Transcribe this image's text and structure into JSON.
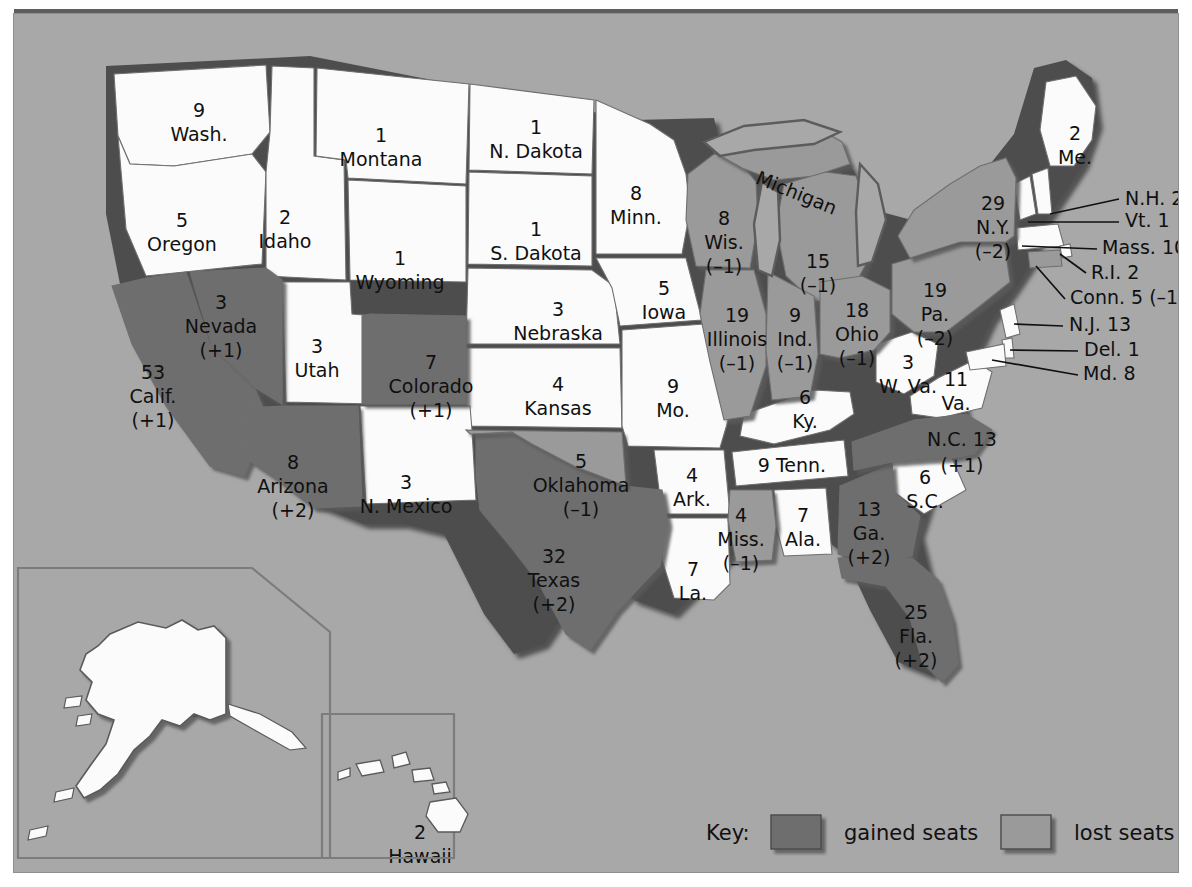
{
  "map": {
    "title": "United States Congressional Apportionment Map",
    "colors": {
      "background": "#a8a8a8",
      "page": "#ffffff",
      "no_change": "#fbfbfb",
      "gained": "#6e6e6e",
      "lost": "#9a9a9a",
      "border": "#3c3c3c",
      "text": "#101010"
    }
  },
  "key": {
    "label": "Key:",
    "items": [
      {
        "swatch": "gained",
        "label": "gained seats",
        "color": "#6e6e6e"
      },
      {
        "swatch": "lost",
        "label": "lost seats",
        "color": "#9a9a9a"
      }
    ]
  },
  "insets": [
    {
      "name": "alaska-inset"
    },
    {
      "name": "hawaii-inset"
    }
  ],
  "states": [
    {
      "id": "wa",
      "name": "Wash.",
      "seats": "9",
      "change": "",
      "status": "no_change",
      "x": 185,
      "y": 103
    },
    {
      "id": "or",
      "name": "Oregon",
      "seats": "5",
      "change": "",
      "status": "no_change",
      "x": 168,
      "y": 213
    },
    {
      "id": "ca",
      "name": "Calif.",
      "seats": "53",
      "change": "(+1)",
      "status": "gained",
      "x": 139,
      "y": 365
    },
    {
      "id": "id",
      "name": "Idaho",
      "seats": "2",
      "change": "",
      "status": "no_change",
      "x": 271,
      "y": 210
    },
    {
      "id": "nv",
      "name": "Nevada",
      "seats": "3",
      "change": "(+1)",
      "status": "gained",
      "x": 207,
      "y": 295
    },
    {
      "id": "ut",
      "name": "Utah",
      "seats": "3",
      "change": "",
      "status": "no_change",
      "x": 303,
      "y": 339
    },
    {
      "id": "az",
      "name": "Arizona",
      "seats": "8",
      "change": "(+2)",
      "status": "gained",
      "x": 279,
      "y": 455
    },
    {
      "id": "mt",
      "name": "Montana",
      "seats": "1",
      "change": "",
      "status": "no_change",
      "x": 367,
      "y": 128
    },
    {
      "id": "wy",
      "name": "Wyoming",
      "seats": "1",
      "change": "",
      "status": "no_change",
      "x": 386,
      "y": 251
    },
    {
      "id": "co",
      "name": "Colorado",
      "seats": "7",
      "change": "(+1)",
      "status": "gained",
      "x": 417,
      "y": 355
    },
    {
      "id": "nm",
      "name": "N. Mexico",
      "seats": "3",
      "change": "",
      "status": "no_change",
      "x": 392,
      "y": 475
    },
    {
      "id": "nd",
      "name": "N. Dakota",
      "seats": "1",
      "change": "",
      "status": "no_change",
      "x": 522,
      "y": 120
    },
    {
      "id": "sd",
      "name": "S. Dakota",
      "seats": "1",
      "change": "",
      "status": "no_change",
      "x": 522,
      "y": 222
    },
    {
      "id": "ne",
      "name": "Nebraska",
      "seats": "3",
      "change": "",
      "status": "no_change",
      "x": 544,
      "y": 302
    },
    {
      "id": "ks",
      "name": "Kansas",
      "seats": "4",
      "change": "",
      "status": "no_change",
      "x": 544,
      "y": 377
    },
    {
      "id": "ok",
      "name": "Oklahoma",
      "seats": "5",
      "change": "(–1)",
      "status": "lost",
      "x": 567,
      "y": 454
    },
    {
      "id": "tx",
      "name": "Texas",
      "seats": "32",
      "change": "(+2)",
      "status": "gained",
      "x": 540,
      "y": 549
    },
    {
      "id": "mn",
      "name": "Minn.",
      "seats": "8",
      "change": "",
      "status": "no_change",
      "x": 622,
      "y": 186
    },
    {
      "id": "ia",
      "name": "Iowa",
      "seats": "5",
      "change": "",
      "status": "no_change",
      "x": 650,
      "y": 281
    },
    {
      "id": "mo",
      "name": "Mo.",
      "seats": "9",
      "change": "",
      "status": "no_change",
      "x": 659,
      "y": 379
    },
    {
      "id": "ar",
      "name": "Ark.",
      "seats": "4",
      "change": "",
      "status": "no_change",
      "x": 678,
      "y": 468
    },
    {
      "id": "la",
      "name": "La.",
      "seats": "7",
      "change": "",
      "status": "no_change",
      "x": 679,
      "y": 562
    },
    {
      "id": "wi",
      "name": "Wis.",
      "seats": "8",
      "change": "(–1)",
      "status": "lost",
      "x": 710,
      "y": 211
    },
    {
      "id": "il",
      "name": "Illinois",
      "seats": "19",
      "change": "(–1)",
      "status": "lost",
      "x": 723,
      "y": 308
    },
    {
      "id": "ms",
      "name": "Miss.",
      "seats": "4",
      "change": "(–1)",
      "status": "lost",
      "x": 727,
      "y": 508
    },
    {
      "id": "mi",
      "name": "Michigan",
      "seats": "15",
      "change": "(–1)",
      "status": "lost",
      "x": 800,
      "y": 252
    },
    {
      "id": "in",
      "name": "Ind.",
      "seats": "9",
      "change": "(–1)",
      "status": "lost",
      "x": 781,
      "y": 308
    },
    {
      "id": "ky",
      "name": "Ky.",
      "seats": "6",
      "change": "",
      "status": "no_change",
      "x": 791,
      "y": 390
    },
    {
      "id": "tn",
      "name": "Tenn.",
      "seats": "9",
      "change": "",
      "status": "no_change",
      "x": 778,
      "y": 458
    },
    {
      "id": "al",
      "name": "Ala.",
      "seats": "7",
      "change": "",
      "status": "no_change",
      "x": 789,
      "y": 508
    },
    {
      "id": "oh",
      "name": "Ohio",
      "seats": "18",
      "change": "(–1)",
      "status": "lost",
      "x": 843,
      "y": 303
    },
    {
      "id": "ga",
      "name": "Ga.",
      "seats": "13",
      "change": "(+2)",
      "status": "gained",
      "x": 855,
      "y": 502
    },
    {
      "id": "fl",
      "name": "Fla.",
      "seats": "25",
      "change": "(+2)",
      "status": "gained",
      "x": 902,
      "y": 605
    },
    {
      "id": "sc",
      "name": "S.C.",
      "seats": "6",
      "change": "",
      "status": "no_change",
      "x": 911,
      "y": 470
    },
    {
      "id": "wv",
      "name": "W. Va.",
      "seats": "3",
      "change": "",
      "status": "no_change",
      "x": 894,
      "y": 355
    },
    {
      "id": "va",
      "name": "Va.",
      "seats": "11",
      "change": "",
      "status": "no_change",
      "x": 942,
      "y": 372
    },
    {
      "id": "pa",
      "name": "Pa.",
      "seats": "19",
      "change": "(–2)",
      "status": "lost",
      "x": 921,
      "y": 283
    },
    {
      "id": "ny",
      "name": "N.Y.",
      "seats": "29",
      "change": "(–2)",
      "status": "lost",
      "x": 979,
      "y": 196
    },
    {
      "id": "me",
      "name": "Me.",
      "seats": "2",
      "change": "",
      "status": "no_change",
      "x": 1061,
      "y": 126
    }
  ],
  "callouts": [
    {
      "id": "nh",
      "label": "N.H. 2",
      "status": "no_change",
      "tx": 1111,
      "ty": 191,
      "x1": 1105,
      "y1": 185,
      "x2": 1036,
      "y2": 200
    },
    {
      "id": "vt",
      "label": "Vt. 1",
      "status": "no_change",
      "tx": 1111,
      "ty": 213,
      "x1": 1105,
      "y1": 208,
      "x2": 1017,
      "y2": 208
    },
    {
      "id": "ma",
      "label": "Mass. 10",
      "status": "no_change",
      "tx": 1088,
      "ty": 240,
      "x1": 1083,
      "y1": 235,
      "x2": 1009,
      "y2": 238
    },
    {
      "id": "ri",
      "label": "R.I. 2",
      "status": "no_change",
      "tx": 1077,
      "ty": 265,
      "x1": 1072,
      "y1": 259,
      "x2": 1036,
      "y2": 246
    },
    {
      "id": "ct",
      "label": "Conn. 5 (–1)",
      "status": "lost",
      "tx": 1056,
      "ty": 290,
      "x1": 1051,
      "y1": 285,
      "x2": 1022,
      "y2": 257
    },
    {
      "id": "nj",
      "label": "N.J. 13",
      "status": "no_change",
      "tx": 1055,
      "ty": 317,
      "x1": 1049,
      "y1": 312,
      "x2": 1000,
      "y2": 313
    },
    {
      "id": "de",
      "label": "Del. 1",
      "status": "no_change",
      "tx": 1070,
      "ty": 342,
      "x1": 1064,
      "y1": 337,
      "x2": 997,
      "y2": 340
    },
    {
      "id": "md",
      "label": "Md. 8",
      "status": "no_change",
      "tx": 1069,
      "ty": 366,
      "x1": 1064,
      "y1": 361,
      "x2": 990,
      "y2": 349
    },
    {
      "id": "nc",
      "label": "N.C. 13",
      "status": "gained",
      "tx": 948,
      "ty": 432,
      "x1": 0,
      "y1": 0,
      "x2": 0,
      "y2": 0
    }
  ],
  "inset_states": [
    {
      "id": "ak",
      "name": "Alaska",
      "seats": "1",
      "status": "no_change",
      "x": 177,
      "y": 679
    },
    {
      "id": "hi",
      "name": "Hawaii",
      "seats": "2",
      "status": "no_change",
      "x": 406,
      "y": 825
    }
  ],
  "nc_change": "(+1)"
}
